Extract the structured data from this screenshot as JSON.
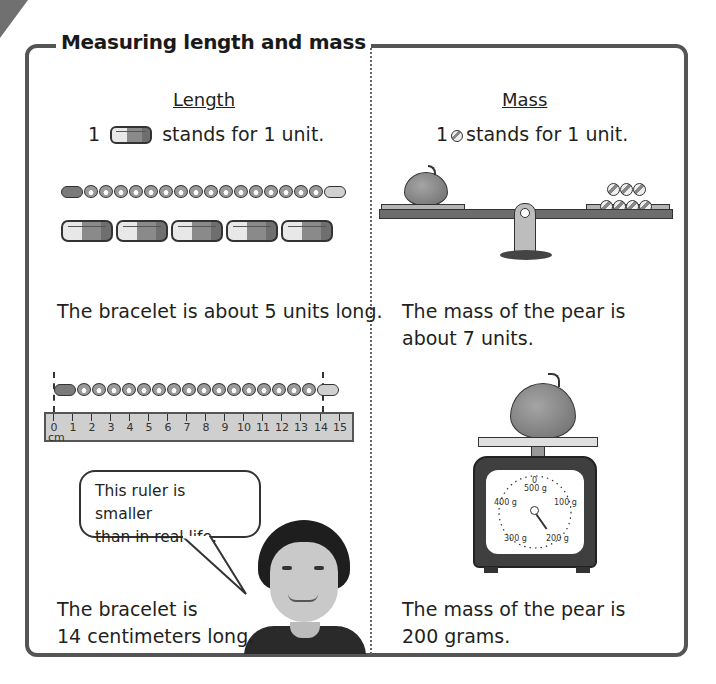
{
  "title": "Measuring length and mass",
  "length": {
    "heading": "Length",
    "unit_prefix": "1",
    "unit_suffix": "stands for 1 unit.",
    "unit_icon": "block-unit-icon",
    "bracelet_units": 5,
    "result_units": "The bracelet is about 5 units long.",
    "ruler": {
      "unit": "cm",
      "ticks": [
        "0",
        "1",
        "2",
        "3",
        "4",
        "5",
        "6",
        "7",
        "8",
        "9",
        "10",
        "11",
        "12",
        "13",
        "14",
        "15"
      ],
      "bracelet_start": 0,
      "bracelet_end": 14
    },
    "bubble": "This ruler is smaller than in real life.",
    "bubble_line1": "This ruler is smaller",
    "bubble_line2": "than in real life.",
    "result_line1": "The bracelet is",
    "result_line2": "14 centimeters long."
  },
  "mass": {
    "heading": "Mass",
    "unit_prefix": "1",
    "unit_suffix": "stands for 1 unit.",
    "unit_icon": "marble-unit-icon",
    "marbles_on_scale": 7,
    "result_units_line1": "The mass of the pear is",
    "result_units_line2": "about 7 units.",
    "dial": {
      "labels": [
        "0",
        "500 g",
        "100 g",
        "200 g",
        "300 g",
        "400 g"
      ],
      "reading": "200 g"
    },
    "result_line1": "The mass of the pear is",
    "result_line2": "200 grams."
  }
}
